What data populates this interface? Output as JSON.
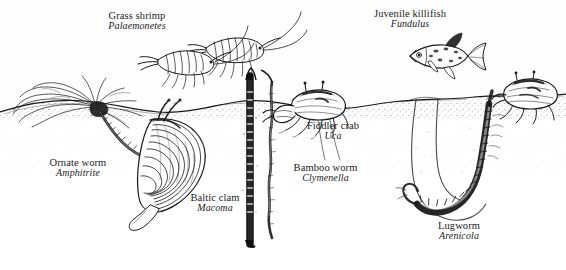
{
  "figure": {
    "background_color": "#fefefe",
    "ink_color": "#1a1a1a",
    "width": 566,
    "height": 270
  },
  "labels": [
    {
      "id": "grass-shrimp",
      "common": "Grass shrimp",
      "genus": "Palaemonetes",
      "habitat": "water-column"
    },
    {
      "id": "killifish",
      "common": "Juvenile killifish",
      "genus": "Fundulus",
      "habitat": "water-column"
    },
    {
      "id": "fiddler-crab",
      "common": "Fiddler crab",
      "genus": "Uca",
      "habitat": "surface"
    },
    {
      "id": "ornate-worm",
      "common": "Ornate worm",
      "genus": "Amphitrite",
      "habitat": "surface-burrow"
    },
    {
      "id": "baltic-clam",
      "common": "Baltic clam",
      "genus": "Macoma",
      "habitat": "shallow-infauna"
    },
    {
      "id": "bamboo-worm",
      "common": "Bamboo worm",
      "genus": "Clymenella",
      "habitat": "deep-tube"
    },
    {
      "id": "lugworm",
      "common": "Lugworm",
      "genus": "Arenicola",
      "habitat": "deep-burrow"
    }
  ],
  "scene": {
    "sediment_surface_label": "sediment surface",
    "water_region_label": "water column",
    "sediment_region_label": "sediment"
  },
  "caption": {
    "cropped_text": ""
  }
}
